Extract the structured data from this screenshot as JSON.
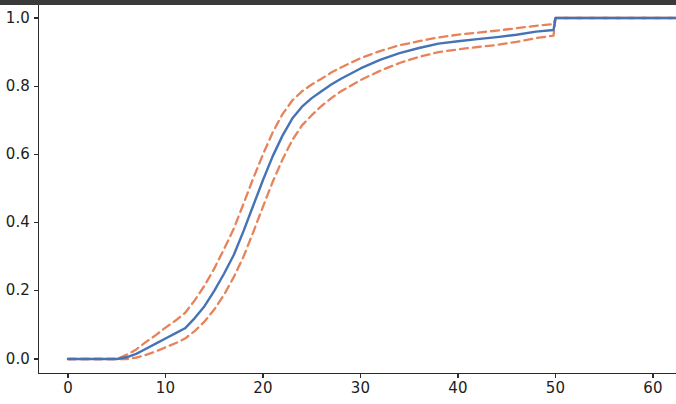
{
  "figure": {
    "width": 676,
    "height": 404,
    "background_color": "#ffffff",
    "top_crop_band_color": "#3a3a3a"
  },
  "axes": {
    "x_ticks": [
      "0",
      "10",
      "20",
      "30",
      "40",
      "50",
      "60"
    ],
    "y_ticks": [
      "0.0",
      "0.2",
      "0.4",
      "0.6",
      "0.8",
      "1.0"
    ],
    "x_tick_values": [
      0,
      10,
      20,
      30,
      40,
      50,
      60
    ],
    "y_tick_values": [
      0.0,
      0.2,
      0.4,
      0.6,
      0.8,
      1.0
    ],
    "xlim": [
      -2.5,
      62.5
    ],
    "ylim": [
      -0.045,
      1.055
    ],
    "spine_color": "#2b2b2b",
    "tick_label_color": "#1d1d1d"
  },
  "colors": {
    "estimate_line": "#4573b5",
    "confidence_band": "#e8825a"
  },
  "chart_data": {
    "type": "line",
    "title": "",
    "xlabel": "",
    "ylabel": "",
    "xlim": [
      -2.5,
      62.5
    ],
    "ylim": [
      -0.045,
      1.055
    ],
    "grid": false,
    "legend": null,
    "x": [
      0,
      2,
      4,
      5,
      6,
      7,
      8,
      9,
      10,
      11,
      12,
      13,
      14,
      15,
      16,
      17,
      18,
      19,
      20,
      21,
      22,
      23,
      24,
      25,
      26,
      27,
      28,
      30,
      32,
      34,
      36,
      38,
      40,
      42,
      44,
      46,
      48,
      49.8,
      50,
      52,
      55,
      58,
      60,
      62.5
    ],
    "series": [
      {
        "name": "estimate",
        "style": "solid",
        "color": "#4573b5",
        "values": [
          0.0,
          0.0,
          0.0,
          0.0,
          0.005,
          0.015,
          0.03,
          0.045,
          0.06,
          0.075,
          0.09,
          0.12,
          0.155,
          0.2,
          0.25,
          0.305,
          0.375,
          0.45,
          0.525,
          0.595,
          0.655,
          0.705,
          0.74,
          0.765,
          0.785,
          0.805,
          0.822,
          0.852,
          0.877,
          0.897,
          0.912,
          0.925,
          0.932,
          0.938,
          0.944,
          0.951,
          0.96,
          0.965,
          1.0,
          1.0,
          1.0,
          1.0,
          1.0,
          1.0
        ]
      },
      {
        "name": "upper_confidence_bound",
        "style": "dashed",
        "color": "#e8825a",
        "values": [
          0.0,
          0.0,
          0.0,
          0.0,
          0.012,
          0.028,
          0.05,
          0.07,
          0.092,
          0.112,
          0.135,
          0.172,
          0.215,
          0.265,
          0.322,
          0.382,
          0.455,
          0.53,
          0.6,
          0.665,
          0.718,
          0.758,
          0.785,
          0.805,
          0.822,
          0.84,
          0.855,
          0.882,
          0.903,
          0.92,
          0.932,
          0.943,
          0.951,
          0.957,
          0.963,
          0.97,
          0.977,
          0.982,
          1.0,
          1.0,
          1.0,
          1.0,
          1.0,
          1.0
        ]
      },
      {
        "name": "lower_confidence_bound",
        "style": "dashed",
        "color": "#e8825a",
        "values": [
          0.0,
          0.0,
          0.0,
          0.0,
          0.0,
          0.004,
          0.012,
          0.022,
          0.034,
          0.046,
          0.06,
          0.082,
          0.11,
          0.145,
          0.188,
          0.24,
          0.3,
          0.372,
          0.447,
          0.52,
          0.585,
          0.642,
          0.685,
          0.715,
          0.742,
          0.765,
          0.785,
          0.818,
          0.845,
          0.868,
          0.886,
          0.9,
          0.908,
          0.915,
          0.921,
          0.93,
          0.941,
          0.948,
          1.0,
          1.0,
          1.0,
          1.0,
          1.0,
          1.0
        ]
      }
    ]
  }
}
